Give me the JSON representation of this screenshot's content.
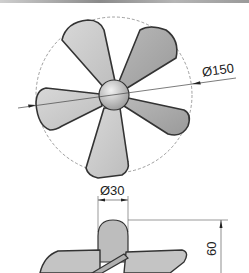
{
  "drawing": {
    "title": "Five-blade propeller technical drawing",
    "views": [
      {
        "name": "top-view",
        "description": "Plan view of propeller with five blades around a spherical hub"
      },
      {
        "name": "side-view",
        "description": "Side elevation of propeller hub with blades"
      }
    ],
    "dimensions": {
      "outer_diameter": "Ø150",
      "hub_diameter": "Ø30",
      "height": "60"
    },
    "colors": {
      "blade_light": "#cfcfcf",
      "blade_dark": "#a9a9a9",
      "outline": "#333333",
      "dim_line": "#555555"
    }
  }
}
